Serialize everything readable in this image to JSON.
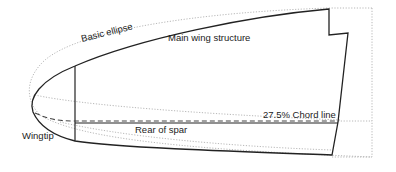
{
  "diagram": {
    "labels": {
      "basic_ellipse": "Basic ellipse",
      "main_wing_structure": "Main wing structure",
      "chord_line": "27.5% Chord line",
      "rear_of_spar": "Rear of spar",
      "wingtip": "Wingtip"
    },
    "colors": {
      "outline": "#222222",
      "ellipse": "#b0b0b0",
      "dashed": "#444444"
    }
  }
}
